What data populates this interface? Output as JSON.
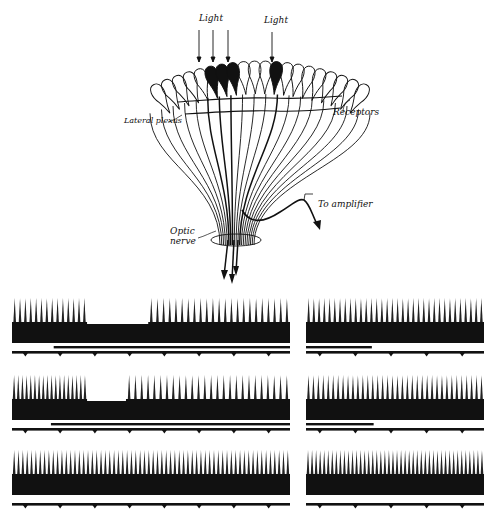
{
  "diagram": {
    "labels": {
      "light_left": "Light",
      "light_right": "Light",
      "receptors": "Receptors",
      "lateral_plexus": "Lateral plexus",
      "to_amplifier": "To amplifier",
      "optic_nerve_line1": "Optic",
      "optic_nerve_line2": "nerve"
    },
    "illuminated_receptors": 4,
    "total_receptors": 20,
    "colors": {
      "ink": "#111111",
      "background": "#ffffff"
    }
  },
  "recordings": [
    {
      "id": "row1-left",
      "x": 12,
      "y": 298,
      "w": 278,
      "spikes_before": 14,
      "gap_start": 0.27,
      "gap_end": 0.49,
      "spikes_after": 23,
      "inhibit_bar_start": 0.15,
      "timer_ticks": 8,
      "has_signal_bar": true
    },
    {
      "id": "row1-right",
      "x": 306,
      "y": 298,
      "w": 178,
      "spikes_before": 0,
      "gap_start": 0,
      "gap_end": 0,
      "spikes_after": 34,
      "inhibit_bar_start": 0,
      "inhibit_bar_end": 0.37,
      "timer_ticks": 5,
      "has_signal_bar": true
    },
    {
      "id": "row2-left",
      "x": 12,
      "y": 375,
      "w": 278,
      "spikes_before": 18,
      "gap_start": 0.27,
      "gap_end": 0.41,
      "spikes_after": 26,
      "inhibit_bar_start": 0.14,
      "timer_ticks": 8,
      "has_signal_bar": true
    },
    {
      "id": "row2-right",
      "x": 306,
      "y": 375,
      "w": 178,
      "spikes_before": 0,
      "gap_start": 0,
      "gap_end": 0,
      "spikes_after": 36,
      "inhibit_bar_start": 0,
      "inhibit_bar_end": 0.38,
      "timer_ticks": 5,
      "has_signal_bar": true
    },
    {
      "id": "row3-left",
      "x": 12,
      "y": 450,
      "w": 278,
      "spikes_before": 0,
      "gap_start": 0,
      "gap_end": 0,
      "spikes_after": 64,
      "inhibit_bar_start": 0,
      "timer_ticks": 8,
      "has_signal_bar": false
    },
    {
      "id": "row3-right",
      "x": 306,
      "y": 450,
      "w": 178,
      "spikes_before": 0,
      "gap_start": 0,
      "gap_end": 0,
      "spikes_after": 44,
      "inhibit_bar_start": 0,
      "timer_ticks": 5,
      "has_signal_bar": false
    }
  ]
}
